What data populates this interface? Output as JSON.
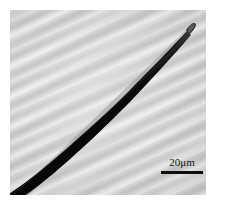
{
  "figure": {
    "kind": "micrograph",
    "modality": "scanning-electron-micrograph",
    "background_color": "#d2d2d2",
    "fiber_color": "#0a0a0a",
    "frame_color": "#ffffff"
  },
  "scale_bar": {
    "label": "20μm",
    "value": 20,
    "unit": "μm",
    "bar_length_px": 42,
    "position": "bottom-right",
    "color": "#0d0d0d"
  },
  "annotations": {
    "fiber_tip_note": "blunt rounded tip, upper right",
    "fiber_base_note": "thick end exits lower-left edge"
  }
}
